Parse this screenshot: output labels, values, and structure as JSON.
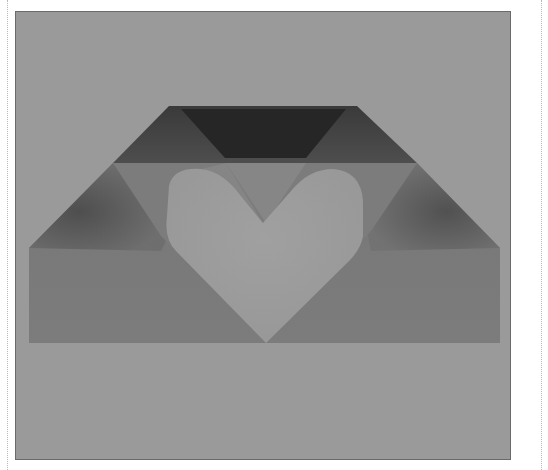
{
  "image": {
    "subject": "Origami envelope with heart-shaped cutout",
    "description": "Grayscale photograph of a folded paper envelope open at the top, revealing a lighter heart shape through the front flaps, set against a plain gray background inside a thin frame.",
    "colors": {
      "background": "#9a9a9a",
      "frame_border": "#6a6a6a",
      "envelope_body": "#7f7f7f",
      "side_flap_shadow": "#5e5e5e",
      "top_flap_dark": "#2a2a2a",
      "top_flap_mid": "#4a4a4a",
      "inner_pocket": "#858585",
      "heart": "#9c9c9c",
      "dotted_rules": "#b8b8b8"
    }
  }
}
